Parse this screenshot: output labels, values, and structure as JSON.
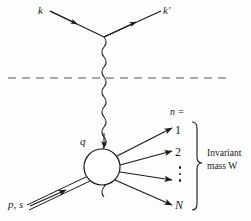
{
  "figure": {
    "type": "feynman-diagram",
    "background_color": "#fdfdfd",
    "line_color": "#1a1a1a"
  },
  "labels": {
    "incoming_lepton": "k",
    "outgoing_lepton": "k′",
    "virtual_photon_momentum": "q",
    "target_nucleon": "p, s",
    "multiplicity_header": "n =",
    "final_state_1": "1",
    "final_state_2": "2",
    "final_state_N": "N",
    "bracket_line1": "Invariant",
    "bracket_line2": "mass W"
  },
  "elements": {
    "incoming_lepton_line": "incoming-lepton-line",
    "outgoing_lepton_line": "outgoing-lepton-line",
    "photon_propagator": "wavy-photon-line",
    "horizontal_dashed_divider": "dashed-divider-line",
    "hadronic_blob": "hadron-blob-circle",
    "nucleon_double_line": "nucleon-double-line",
    "final_state_lines": [
      "final-state-line-1",
      "final-state-line-2",
      "final-state-line-3",
      "final-state-line-N"
    ],
    "right_brace": "invariant-mass-brace",
    "vertical_dots": "vertical-ellipsis-dots"
  },
  "geometry": {
    "lepton_vertex": [
      104,
      37
    ],
    "blob_center": [
      102,
      167
    ],
    "blob_radius": 18,
    "dashed_line_y": 78,
    "dashed_line_x_range": [
      8,
      228
    ]
  }
}
